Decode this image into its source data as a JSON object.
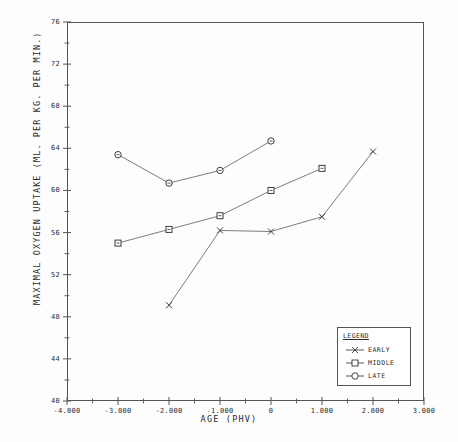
{
  "chart_data": {
    "type": "line",
    "title": "",
    "xlabel": "AGE  (PHV)",
    "ylabel": "MAXIMAL OXYGEN UPTAKE (ML. PER KG. PER MIN.)",
    "xlim": [
      -4.0,
      3.0
    ],
    "ylim": [
      40,
      76
    ],
    "xticks": [
      "-4.000",
      "-3.000",
      "-2.000",
      "-1.000",
      "0",
      "1.000",
      "2.000",
      "3.000"
    ],
    "xtick_values": [
      -4,
      -3,
      -2,
      -1,
      0,
      1,
      2,
      3
    ],
    "yticks": [
      "76",
      "72",
      "68",
      "64",
      "60",
      "56",
      "52",
      "48",
      "44",
      "40"
    ],
    "ytick_values": [
      76,
      72,
      68,
      64,
      60,
      56,
      52,
      48,
      44,
      40
    ],
    "minor_tick_step": 0.5,
    "grid": false,
    "legend_position": "lower-right",
    "legend_title": "LEGEND",
    "series": [
      {
        "name": "EARLY",
        "marker": "x",
        "x": [
          -2,
          -1,
          0,
          1,
          2
        ],
        "values": [
          49.1,
          56.2,
          56.1,
          57.5,
          63.7
        ]
      },
      {
        "name": "MIDDLE",
        "marker": "square",
        "x": [
          -3,
          -2,
          -1,
          0,
          1
        ],
        "values": [
          55.0,
          56.3,
          57.6,
          60.0,
          62.1
        ]
      },
      {
        "name": "LATE",
        "marker": "circle",
        "x": [
          -3,
          -2,
          -1,
          0
        ],
        "values": [
          63.4,
          60.7,
          61.9,
          64.7
        ]
      }
    ]
  },
  "legend": {
    "title": "LEGEND",
    "entries": [
      {
        "label": "EARLY",
        "marker": "x-marker-icon"
      },
      {
        "label": "MIDDLE",
        "marker": "square-marker-icon"
      },
      {
        "label": "LATE",
        "marker": "circle-marker-icon"
      }
    ]
  },
  "caption": {
    "text": ""
  }
}
